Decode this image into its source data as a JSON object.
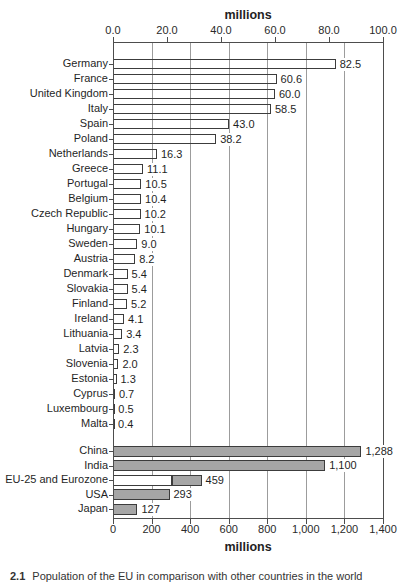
{
  "chart_data": {
    "type": "bar",
    "orientation": "horizontal",
    "top_axis": {
      "title": "millions",
      "range": [
        0,
        100
      ],
      "tick_labels": [
        "0.0",
        "20.0",
        "40.0",
        "60.0",
        "80.0",
        "100.0"
      ],
      "tick_values": [
        0,
        20,
        40,
        60,
        80,
        100
      ],
      "position": "top"
    },
    "bottom_axis": {
      "title": "millions",
      "range": [
        0,
        1400
      ],
      "tick_labels": [
        "0",
        "200",
        "400",
        "600",
        "800",
        "1,000",
        "1,200",
        "1,400"
      ],
      "tick_values": [
        0,
        200,
        400,
        600,
        800,
        1000,
        1200,
        1400
      ],
      "position": "bottom"
    },
    "grid": "vertical gridlines at bottom-axis tick positions, spanning full plot height",
    "series": [
      {
        "name": "EU member states (read on top axis)",
        "axis": "top",
        "bar_fill": "white",
        "categories": [
          "Germany",
          "France",
          "United Kingdom",
          "Italy",
          "Spain",
          "Poland",
          "Netherlands",
          "Greece",
          "Portugal",
          "Belgium",
          "Czech Republic",
          "Hungary",
          "Sweden",
          "Austria",
          "Denmark",
          "Slovakia",
          "Finland",
          "Ireland",
          "Lithuania",
          "Latvia",
          "Slovenia",
          "Estonia",
          "Cyprus",
          "Luxembourg",
          "Malta"
        ],
        "values": [
          82.5,
          60.6,
          60.0,
          58.5,
          43.0,
          38.2,
          16.3,
          11.1,
          10.5,
          10.4,
          10.2,
          10.1,
          9.0,
          8.2,
          5.4,
          5.4,
          5.2,
          4.1,
          3.4,
          2.3,
          2.0,
          1.3,
          0.7,
          0.5,
          0.4
        ],
        "value_labels": [
          "82.5",
          "60.6",
          "60.0",
          "58.5",
          "43.0",
          "38.2",
          "16.3",
          "11.1",
          "10.5",
          "10.4",
          "10.2",
          "10.1",
          "9.0",
          "8.2",
          "5.4",
          "5.4",
          "5.2",
          "4.1",
          "3.4",
          "2.3",
          "2.0",
          "1.3",
          "0.7",
          "0.5",
          "0.4"
        ]
      },
      {
        "name": "World comparison (read on bottom axis)",
        "axis": "bottom",
        "bar_fill": "gray",
        "categories": [
          "China",
          "India",
          "EU-25 and Eurozone",
          "USA",
          "Japan"
        ],
        "values": [
          1288,
          1100,
          459,
          293,
          127
        ],
        "value_labels": [
          "1,288",
          "1,100",
          "459",
          "293",
          "127"
        ],
        "segments": {
          "EU-25 and Eurozone": [
            {
              "fill": "white",
              "from": 0,
              "to": 307
            },
            {
              "fill": "gray",
              "from": 307,
              "to": 459
            }
          ]
        }
      }
    ]
  },
  "caption": {
    "number": "2.1",
    "text": "Population of the EU in comparison with other countries in the world"
  },
  "colors": {
    "gray_bar_fill": "#a6a6a6",
    "bar_border": "#3c3c3c",
    "axis_line": "#4d4d4d",
    "gridline": "#9c9c9c",
    "text": "#1f1f1f",
    "background": "#ffffff"
  }
}
